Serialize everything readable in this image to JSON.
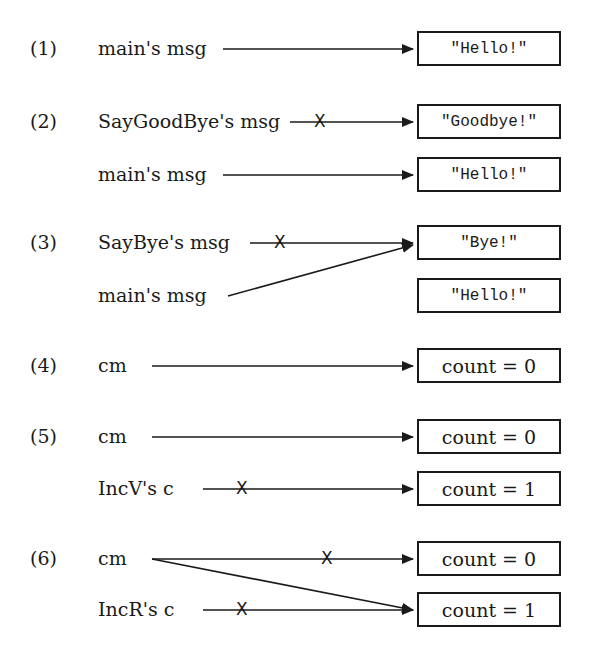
{
  "diagram": {
    "sections": [
      {
        "step": "(1)",
        "rows": [
          {
            "var": "main's msg",
            "value": "\"Hello!\"",
            "crossed": false
          }
        ]
      },
      {
        "step": "(2)",
        "rows": [
          {
            "var": "SayGoodBye's msg",
            "value": "\"Goodbye!\"",
            "crossed": true
          },
          {
            "var": "main's msg",
            "value": "\"Hello!\"",
            "crossed": false
          }
        ]
      },
      {
        "step": "(3)",
        "rows": [
          {
            "var": "SayBye's msg",
            "value": "\"Bye!\"",
            "crossed": true
          },
          {
            "var": "main's msg",
            "value": "\"Hello!\"",
            "crossed": false,
            "points_to": "\"Bye!\""
          }
        ]
      },
      {
        "step": "(4)",
        "rows": [
          {
            "var": "cm",
            "value": "count = 0",
            "crossed": false
          }
        ]
      },
      {
        "step": "(5)",
        "rows": [
          {
            "var": "cm",
            "value": "count = 0",
            "crossed": false
          },
          {
            "var": "IncV's c",
            "value": "count = 1",
            "crossed": true
          }
        ]
      },
      {
        "step": "(6)",
        "rows": [
          {
            "var": "cm",
            "value": "count = 0",
            "crossed": true,
            "also_points_to": "count = 1"
          },
          {
            "var": "IncR's c",
            "value": "count = 1",
            "crossed": true
          }
        ]
      }
    ],
    "cross_mark": "X",
    "colors": {
      "ink": "#1a1a1a",
      "background": "#ffffff"
    }
  }
}
